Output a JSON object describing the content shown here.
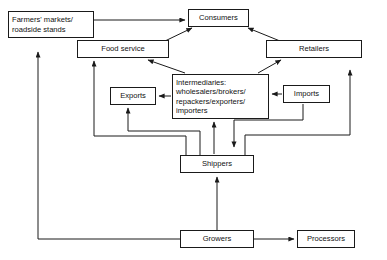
{
  "diagram": {
    "width": 387,
    "height": 260,
    "line_color": "#1a1a1a",
    "box_fill": "#ffffff",
    "text_color": "#111111",
    "nodes": [
      {
        "id": "farmers-markets",
        "label": "Farmers' markets/\nroadside stands",
        "x": 8,
        "y": 11,
        "w": 86,
        "h": 27,
        "align": "left-label"
      },
      {
        "id": "consumers",
        "label": "Consumers",
        "x": 188,
        "y": 9,
        "w": 61,
        "h": 18,
        "align": "center-label"
      },
      {
        "id": "food-service",
        "label": "Food service",
        "x": 77,
        "y": 40,
        "w": 92,
        "h": 18,
        "align": "center-label"
      },
      {
        "id": "retailers",
        "label": "Retailers",
        "x": 266,
        "y": 40,
        "w": 96,
        "h": 18,
        "align": "center-label"
      },
      {
        "id": "intermediaries",
        "label": "Intermediaries:\nwholesalers/brokers/\nrepackers/exporters/\nimporters",
        "x": 172,
        "y": 74,
        "w": 97,
        "h": 45,
        "align": "left-label"
      },
      {
        "id": "exports",
        "label": "Exports",
        "x": 110,
        "y": 87,
        "w": 46,
        "h": 18,
        "align": "center-label"
      },
      {
        "id": "imports",
        "label": "Imports",
        "x": 283,
        "y": 85,
        "w": 47,
        "h": 18,
        "align": "center-label"
      },
      {
        "id": "shippers",
        "label": "Shippers",
        "x": 180,
        "y": 155,
        "w": 74,
        "h": 18,
        "align": "center-label"
      },
      {
        "id": "growers",
        "label": "Growers",
        "x": 180,
        "y": 230,
        "w": 74,
        "h": 18,
        "align": "center-label"
      },
      {
        "id": "processors",
        "label": "Processors",
        "x": 297,
        "y": 230,
        "w": 58,
        "h": 18,
        "align": "center-label"
      }
    ],
    "edges": [
      {
        "id": "farmers-to-consumers",
        "from": "farmers-markets",
        "to": "consumers",
        "points": "94,20 185,20",
        "arrow": true
      },
      {
        "id": "food-service-to-consumers",
        "from": "food-service",
        "to": "consumers",
        "points": "165,41 192,28",
        "arrow": true
      },
      {
        "id": "retailers-to-consumers",
        "from": "retailers",
        "to": "consumers",
        "points": "280,41 248,28",
        "arrow": true
      },
      {
        "id": "intermediaries-to-food-service",
        "from": "intermediaries",
        "to": "food-service",
        "points": "185,73 148,60",
        "arrow": true
      },
      {
        "id": "intermediaries-to-retailers",
        "from": "intermediaries",
        "to": "retailers",
        "points": "258,73 281,60",
        "arrow": true
      },
      {
        "id": "intermediaries-to-exports",
        "from": "intermediaries",
        "to": "exports",
        "points": "171,96 159,96",
        "arrow": true
      },
      {
        "id": "imports-to-intermediaries",
        "from": "imports",
        "to": "intermediaries",
        "points": "282,94 272,94",
        "arrow": true
      },
      {
        "id": "shippers-to-exports",
        "from": "shippers",
        "to": "exports",
        "points": "200,155 200,131 128,131 128,108",
        "arrow": true
      },
      {
        "id": "shippers-to-intermediaries",
        "from": "shippers",
        "to": "intermediaries",
        "points": "214,154 214,122",
        "arrow": true
      },
      {
        "id": "imports-to-shippers",
        "from": "imports",
        "to": "shippers",
        "points": "303,104 303,120 234,120 234,147",
        "arrow": true
      },
      {
        "id": "shippers-to-food-service",
        "from": "shippers",
        "to": "food-service",
        "points": "186,155 186,136 94,136 94,61",
        "arrow": true
      },
      {
        "id": "shippers-to-retailers",
        "from": "shippers",
        "to": "retailers",
        "points": "245,155 245,135 350,135 350,70",
        "arrow": true
      },
      {
        "id": "growers-to-shippers",
        "from": "growers",
        "to": "shippers",
        "points": "217,230 217,177",
        "arrow": true
      },
      {
        "id": "growers-to-processors",
        "from": "growers",
        "to": "processors",
        "points": "254,239 294,239",
        "arrow": true
      },
      {
        "id": "growers-to-farmers-markets",
        "from": "growers",
        "to": "farmers-markets",
        "points": "180,239 38,239 38,52",
        "arrow": true
      }
    ]
  }
}
